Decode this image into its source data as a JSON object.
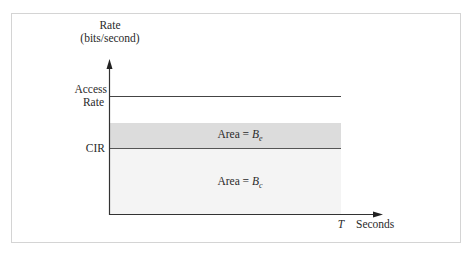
{
  "diagram": {
    "y_axis_label_line1": "Rate",
    "y_axis_label_line2": "(bits/second)",
    "x_axis_label": "Seconds",
    "x_axis_mark": "T",
    "access_rate_label_line1": "Access",
    "access_rate_label_line2": "Rate",
    "cir_label": "CIR",
    "be_area_label": "Area = ",
    "be_symbol": "B",
    "be_subscript": "e",
    "bc_area_label": "Area = ",
    "bc_symbol": "B",
    "bc_subscript": "c",
    "colors": {
      "axis": "#333333",
      "access_rate_line": "#444444",
      "cir_line": "#555555",
      "be_fill": "#dcdcdc",
      "bc_fill": "#f4f4f4",
      "frame": "#d4d4d4"
    }
  }
}
